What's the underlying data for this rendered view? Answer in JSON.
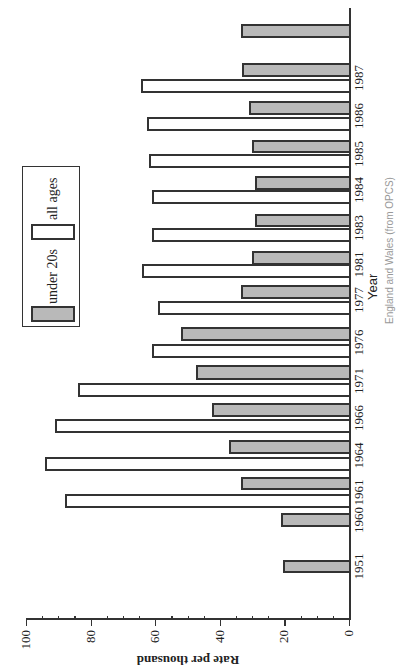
{
  "chart_data": {
    "type": "bar",
    "orientation": "rotated 90 degrees counter-clockwise (values increase leftward, years increase upward)",
    "title": "",
    "xlabel": "Year",
    "ylabel": "Rate per thousand",
    "ylim": [
      0,
      100
    ],
    "yticks": [
      0,
      20,
      40,
      60,
      80,
      100
    ],
    "grid": false,
    "legend_position": "upper-left (of unrotated chart)",
    "categories": [
      "1951",
      "1960",
      "1961",
      "1964",
      "1966",
      "1971",
      "1976",
      "1977",
      "1981",
      "1983",
      "1984",
      "1985",
      "1986",
      "1987",
      ""
    ],
    "series": [
      {
        "name": "under 20s",
        "color": "#b9b9b9",
        "values": [
          20.5,
          21,
          33.5,
          37,
          42.5,
          47.5,
          52,
          33.5,
          30,
          29,
          29,
          30,
          31,
          33,
          33.5
        ]
      },
      {
        "name": "all ages",
        "color": "#ffffff",
        "values": [
          null,
          null,
          88,
          94,
          91,
          84,
          61,
          59,
          64,
          61,
          61,
          62,
          62.5,
          64.5,
          null
        ]
      }
    ],
    "caption": "England and Wales (from OPCS)"
  },
  "labels": {
    "ylabel": "Rate per thousand",
    "xlabel": "Year",
    "legend_under20": "under 20s",
    "legend_all": "all ages",
    "caption": "England and Wales (from OPCS)"
  }
}
